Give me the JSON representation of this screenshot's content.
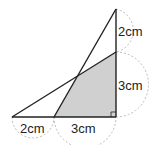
{
  "diagram": {
    "labels": {
      "right_upper": "2cm",
      "right_lower": "3cm",
      "bottom_left": "2cm",
      "bottom_right": "3cm"
    },
    "colors": {
      "line": "#222222",
      "shaded": "#d0d0d0",
      "dashed_arc": "#aaaaaa",
      "background": "#ffffff"
    },
    "shaded_region": "quadrilateral (shaded)",
    "right_angle_marker": true
  }
}
